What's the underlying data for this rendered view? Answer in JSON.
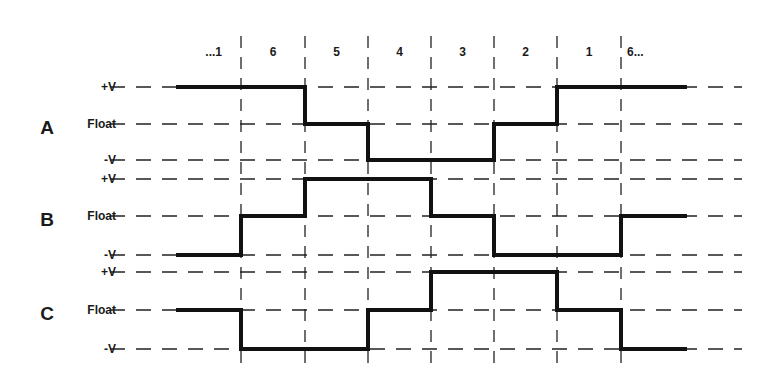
{
  "steps": [
    "...1",
    "6",
    "5",
    "4",
    "3",
    "2",
    "1",
    "6..."
  ],
  "level_labels": {
    "high": "+V",
    "float": "Float",
    "low": "-V"
  },
  "phases": [
    {
      "name": "A",
      "levels": [
        "high",
        "high",
        "float",
        "low",
        "low",
        "float",
        "high",
        "high"
      ]
    },
    {
      "name": "B",
      "levels": [
        "low",
        "float",
        "high",
        "high",
        "float",
        "low",
        "low",
        "float"
      ]
    },
    {
      "name": "C",
      "levels": [
        "float",
        "low",
        "low",
        "float",
        "high",
        "high",
        "float",
        "low"
      ]
    }
  ],
  "colors": {
    "signal": "#111111",
    "grid": "#222222",
    "text": "#1a1a1a"
  }
}
